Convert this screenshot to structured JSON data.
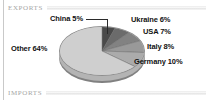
{
  "header": {
    "label": "EXPORTS"
  },
  "footer": {
    "label": "IMPORTS"
  },
  "chart_data": {
    "type": "pie",
    "title": "EXPORTS",
    "xlabel": "",
    "ylabel": "",
    "unit": "%",
    "legend_position": "outside-labels",
    "grid": false,
    "categories": [
      "China",
      "Ukraine",
      "USA",
      "Italy",
      "Germany",
      "Other"
    ],
    "values": [
      5,
      6,
      7,
      8,
      10,
      64
    ],
    "labels": [
      "China 5%",
      "Ukraine 6%",
      "USA 7%",
      "Italy 8%",
      "Germany 10%",
      "Other 64%"
    ],
    "colors": [
      "#4a4a4a",
      "#6b6b6b",
      "#828282",
      "#999999",
      "#ababab",
      "#cfcfcf"
    ],
    "start_angle_deg": 0,
    "direction": "clockwise",
    "style": "3d-exploded-none"
  },
  "pie": {
    "slices": [
      {
        "name": "China",
        "label": "China 5%",
        "value": 5,
        "color": "#4a4a4a"
      },
      {
        "name": "Ukraine",
        "label": "Ukraine 6%",
        "value": 6,
        "color": "#6b6b6b"
      },
      {
        "name": "USA",
        "label": "USA 7%",
        "value": 7,
        "color": "#828282"
      },
      {
        "name": "Italy",
        "label": "Italy 8%",
        "value": 8,
        "color": "#999999"
      },
      {
        "name": "Germany",
        "label": "Germany 10%",
        "value": 10,
        "color": "#ababab"
      },
      {
        "name": "Other",
        "label": "Other 64%",
        "value": 64,
        "color": "#cfcfcf"
      }
    ]
  }
}
